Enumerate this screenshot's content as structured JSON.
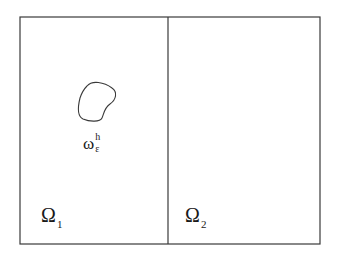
{
  "diagram": {
    "title": "",
    "regions": [
      {
        "id": "omega1",
        "label": "Ω",
        "subscript": "1"
      },
      {
        "id": "omega2",
        "label": "Ω",
        "subscript": "2"
      }
    ],
    "inclusion": {
      "label": "ω",
      "superscript": "h",
      "subscript": "ε"
    },
    "colors": {
      "stroke": "#3a3a3a",
      "background": "#ffffff",
      "text": "#1a1a1a"
    }
  }
}
